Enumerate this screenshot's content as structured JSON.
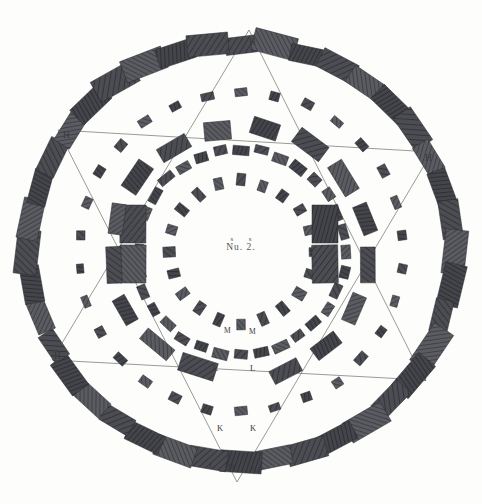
{
  "plate": {
    "title": "Nu. 2.",
    "caption_upper": "s s",
    "caption_lower": "Nu. 2.",
    "subject": "stonehenge-ground-plan",
    "background_color": "#fdfdfb",
    "stone_fill_dark": "#3d3f44",
    "stone_fill_mid": "#54565c",
    "stone_fill_light": "#6a6c71",
    "line_color": "#6e6e6e",
    "label_color": "#3a3a38"
  },
  "labels": [
    {
      "id": "h-top",
      "text": "H",
      "x": 249,
      "y": 38,
      "style": "lbl-h"
    },
    {
      "id": "h-upper-left",
      "text": "H",
      "x": 63,
      "y": 131,
      "style": "lbl-h"
    },
    {
      "id": "h-upper-right",
      "text": "H",
      "x": 425,
      "y": 154,
      "style": "lbl-h"
    },
    {
      "id": "h-lower-left",
      "text": "H",
      "x": 54,
      "y": 352,
      "style": "lbl-h"
    },
    {
      "id": "h-lower-right",
      "text": "H",
      "x": 420,
      "y": 374,
      "style": "lbl-h it"
    },
    {
      "id": "h-bottom",
      "text": "H",
      "x": 228,
      "y": 464,
      "style": "lbl-h"
    },
    {
      "id": "i-bottom-left",
      "text": "I",
      "x": 209,
      "y": 461,
      "style": "lbl-i it"
    },
    {
      "id": "i-bottom-right",
      "text": "I",
      "x": 251,
      "y": 462,
      "style": "lbl-i"
    },
    {
      "id": "k-left",
      "text": "K",
      "x": 217,
      "y": 424,
      "style": "lbl-k"
    },
    {
      "id": "k-right",
      "text": "K",
      "x": 250,
      "y": 424,
      "style": "lbl-k"
    },
    {
      "id": "l-left",
      "text": "L",
      "x": 213,
      "y": 364,
      "style": "lbl-l"
    },
    {
      "id": "l-right",
      "text": "L",
      "x": 250,
      "y": 364,
      "style": "lbl-l"
    },
    {
      "id": "m-left",
      "text": "M",
      "x": 224,
      "y": 327,
      "style": "lbl-m"
    },
    {
      "id": "m-right",
      "text": "M",
      "x": 249,
      "y": 328,
      "style": "lbl-m"
    }
  ],
  "chart_data": {
    "type": "diagram",
    "title": "Nu. 2.",
    "center": {
      "x": 241,
      "y": 252
    },
    "rings": [
      {
        "name": "outer-sarsen-circle",
        "radius": 212,
        "count": 40,
        "stone_w": 38,
        "stone_h": 20
      },
      {
        "name": "second-ring-markers",
        "radius": 163,
        "count": 30,
        "stone_w": 11,
        "stone_h": 8
      },
      {
        "name": "inner-bluestone-circle",
        "radius": 104,
        "count": 32,
        "stone_w": 14,
        "stone_h": 9
      },
      {
        "name": "inner-small-ring",
        "radius": 72,
        "count": 20,
        "stone_w": 9,
        "stone_h": 12
      }
    ],
    "hexagram": {
      "vertices": [
        {
          "label": "H",
          "x": 249,
          "y": 30
        },
        {
          "label": "H",
          "x": 432,
          "y": 152
        },
        {
          "label": "H",
          "x": 424,
          "y": 380
        },
        {
          "label": "H",
          "x": 237,
          "y": 482
        },
        {
          "label": "H",
          "x": 52,
          "y": 360
        },
        {
          "label": "H",
          "x": 58,
          "y": 130
        }
      ],
      "triangles": [
        [
          0,
          2,
          4
        ],
        [
          1,
          3,
          5
        ]
      ]
    },
    "trilithons": [
      {
        "label": "left-upper",
        "x": 133,
        "y": 224,
        "w": 26,
        "h": 38
      },
      {
        "label": "left-lower",
        "x": 133,
        "y": 264,
        "w": 26,
        "h": 38
      },
      {
        "label": "right-upper",
        "x": 325,
        "y": 224,
        "w": 26,
        "h": 38
      },
      {
        "label": "right-lower",
        "x": 325,
        "y": 264,
        "w": 26,
        "h": 38
      }
    ]
  }
}
